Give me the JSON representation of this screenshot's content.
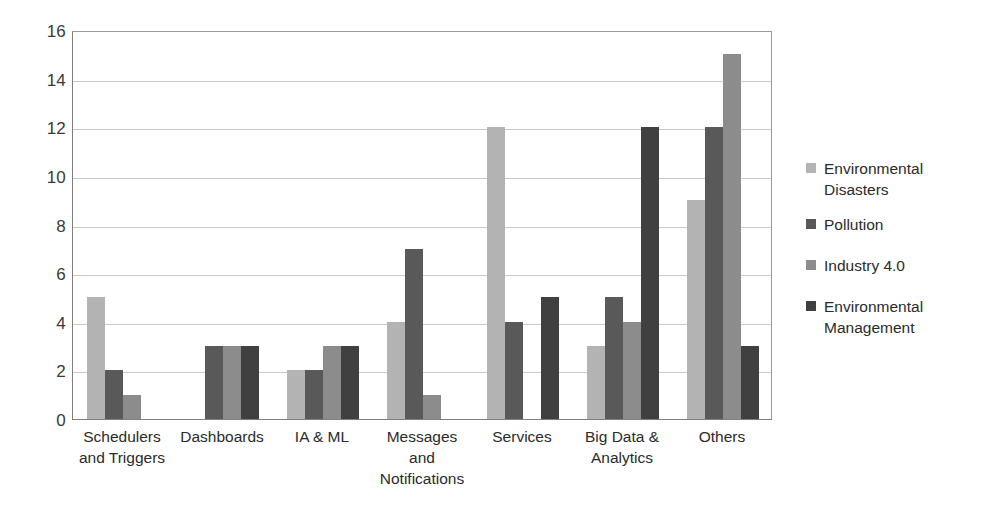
{
  "chart_data": {
    "type": "bar",
    "title": "",
    "subtitle": "",
    "xlabel": "",
    "ylabel": "",
    "ylim": [
      0,
      16
    ],
    "ytick_step": 2,
    "yticks": [
      "16",
      "14",
      "12",
      "10",
      "8",
      "6",
      "4",
      "2",
      "0"
    ],
    "grid": true,
    "legend_position": "right",
    "categories": [
      "Schedulers and Triggers",
      "Dashboards",
      "IA & ML",
      "Messages and Notifications",
      "Services",
      "Big Data & Analytics",
      "Others"
    ],
    "category_lines": [
      [
        "Schedulers",
        "and Triggers"
      ],
      [
        "Dashboards"
      ],
      [
        "IA & ML"
      ],
      [
        "Messages",
        "and",
        "Notifications"
      ],
      [
        "Services"
      ],
      [
        "Big Data &",
        "Analytics"
      ],
      [
        "Others"
      ]
    ],
    "series": [
      {
        "name": "Environmental Disasters",
        "name_lines": [
          "Environmental",
          "Disasters"
        ],
        "color": "#b3b3b3",
        "values": [
          5,
          0,
          2,
          4,
          12,
          3,
          9
        ]
      },
      {
        "name": "Pollution",
        "name_lines": [
          "Pollution"
        ],
        "color": "#595959",
        "values": [
          2,
          3,
          2,
          7,
          4,
          5,
          12
        ]
      },
      {
        "name": "Industry 4.0",
        "name_lines": [
          "Industry 4.0"
        ],
        "color": "#8c8c8c",
        "values": [
          1,
          3,
          3,
          1,
          0,
          4,
          15
        ]
      },
      {
        "name": "Environmental Management",
        "name_lines": [
          "Environmental",
          "Management"
        ],
        "color": "#404040",
        "values": [
          0,
          3,
          3,
          0,
          5,
          12,
          3
        ]
      }
    ]
  }
}
